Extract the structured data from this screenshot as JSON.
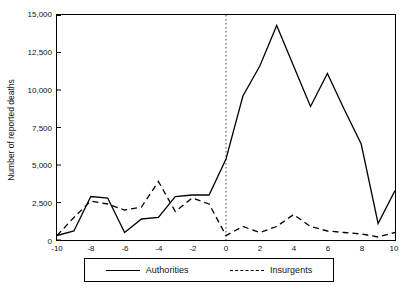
{
  "chart_data": {
    "type": "line",
    "title": "",
    "xlabel": "",
    "ylabel": "Number of reported deaths",
    "xlim": [
      -10,
      10
    ],
    "ylim": [
      0,
      15000
    ],
    "grid": false,
    "legend_position": "bottom",
    "annotations": [
      {
        "type": "vertical-dotted-line",
        "x": 0
      }
    ],
    "x": [
      -10,
      -9,
      -8,
      -7,
      -6,
      -5,
      -4,
      -3,
      -2,
      -1,
      0,
      1,
      2,
      3,
      4,
      5,
      6,
      7,
      8,
      9,
      10
    ],
    "xticks": [
      "-10",
      "-8",
      "-6",
      "-4",
      "-2",
      "0",
      "2",
      "4",
      "6",
      "8",
      "10"
    ],
    "yticks": [
      "0",
      "2,500",
      "5,000",
      "7,500",
      "10,000",
      "12,500",
      "15,000"
    ],
    "series": [
      {
        "name": "Authorities",
        "style": "solid",
        "values": [
          300,
          600,
          2900,
          2800,
          500,
          1400,
          1500,
          2900,
          3000,
          3000,
          5400,
          9600,
          11600,
          14300,
          11600,
          8900,
          11100,
          8700,
          6400,
          1100,
          3300
        ]
      },
      {
        "name": "Insurgents",
        "style": "dashed",
        "values": [
          300,
          1500,
          2600,
          2400,
          2000,
          2200,
          3900,
          1900,
          2800,
          2400,
          300,
          900,
          500,
          900,
          1700,
          900,
          600,
          500,
          400,
          200,
          500
        ]
      }
    ]
  },
  "legend": {
    "items": [
      {
        "label": "Authorities",
        "style": "solid"
      },
      {
        "label": "Insurgents",
        "style": "dashed"
      }
    ]
  }
}
